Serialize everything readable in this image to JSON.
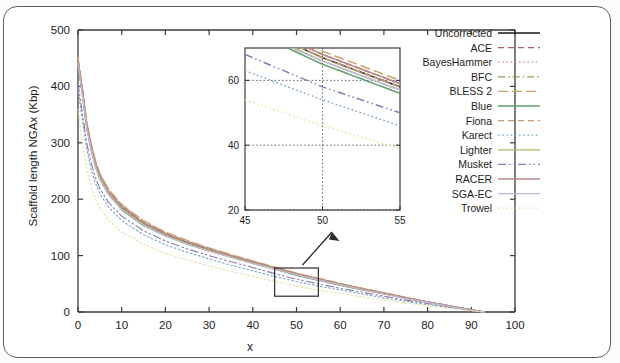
{
  "figure": {
    "xlabel": "x",
    "ylabel": "Scaffold length NGAx (Kbp)"
  },
  "chart_data": {
    "type": "line",
    "title": "",
    "xlabel": "x",
    "ylabel": "Scaffold length NGAx (Kbp)",
    "xlim": [
      0,
      100
    ],
    "ylim": [
      0,
      500
    ],
    "xticks": [
      0,
      10,
      20,
      30,
      40,
      50,
      60,
      70,
      80,
      90,
      100
    ],
    "yticks": [
      0,
      100,
      200,
      300,
      400,
      500
    ],
    "grid": false,
    "legend_position": "top-right",
    "x": [
      0,
      1,
      2,
      3,
      4,
      5,
      7,
      10,
      15,
      20,
      25,
      30,
      35,
      40,
      45,
      50,
      55,
      60,
      65,
      70,
      75,
      80,
      85,
      90,
      93
    ],
    "series": [
      {
        "name": "Uncorrected",
        "color": "#1a1a1a",
        "dash": "solid",
        "values": [
          445,
          392,
          330,
          292,
          262,
          240,
          212,
          185,
          157,
          138,
          123,
          110,
          99,
          88,
          78,
          67,
          58,
          49,
          41,
          33,
          25,
          18,
          11,
          4,
          0
        ]
      },
      {
        "name": "ACE",
        "color": "#b05a5a",
        "dash": "dashed",
        "values": [
          448,
          395,
          334,
          295,
          265,
          243,
          215,
          188,
          159,
          140,
          125,
          112,
          100,
          89,
          79,
          68,
          59,
          50,
          42,
          34,
          26,
          18,
          11,
          4,
          0
        ]
      },
      {
        "name": "BayesHammer",
        "color": "#d08fa0",
        "dash": "dotted",
        "values": [
          450,
          398,
          336,
          297,
          267,
          245,
          217,
          190,
          161,
          141,
          126,
          113,
          101,
          90,
          79,
          68,
          59,
          50,
          42,
          34,
          26,
          18,
          11,
          4,
          0
        ]
      },
      {
        "name": "BFC",
        "color": "#9a9a52",
        "dash": "dashdot",
        "values": [
          444,
          390,
          329,
          291,
          261,
          239,
          211,
          184,
          156,
          137,
          122,
          110,
          99,
          88,
          78,
          67,
          58,
          49,
          41,
          33,
          25,
          18,
          11,
          4,
          0
        ]
      },
      {
        "name": "BLESS 2",
        "color": "#c9a46b",
        "dash": "longdash",
        "values": [
          452,
          400,
          338,
          299,
          269,
          246,
          218,
          191,
          162,
          142,
          127,
          114,
          102,
          91,
          80,
          69,
          60,
          51,
          42,
          34,
          26,
          18,
          11,
          4,
          0
        ]
      },
      {
        "name": "Blue",
        "color": "#5e9e6e",
        "dash": "solid",
        "values": [
          438,
          384,
          324,
          286,
          257,
          235,
          208,
          181,
          153,
          135,
          120,
          108,
          97,
          86,
          76,
          65,
          56,
          47,
          39,
          32,
          24,
          17,
          10,
          3,
          0
        ]
      },
      {
        "name": "Fiona",
        "color": "#c49a7a",
        "dash": "dashed",
        "values": [
          446,
          393,
          332,
          293,
          263,
          241,
          213,
          186,
          158,
          139,
          124,
          111,
          100,
          89,
          78,
          67,
          58,
          49,
          41,
          33,
          25,
          18,
          11,
          4,
          0
        ]
      },
      {
        "name": "Karect",
        "color": "#7aa8c4",
        "dash": "dotted",
        "values": [
          395,
          340,
          290,
          252,
          228,
          210,
          186,
          162,
          137,
          119,
          106,
          94,
          83,
          73,
          63,
          54,
          46,
          39,
          32,
          25,
          19,
          13,
          8,
          3,
          0
        ]
      },
      {
        "name": "Lighter",
        "color": "#a8b86a",
        "dash": "solid",
        "values": [
          442,
          388,
          327,
          289,
          259,
          237,
          210,
          183,
          155,
          136,
          121,
          109,
          98,
          87,
          77,
          66,
          57,
          48,
          40,
          32,
          25,
          17,
          10,
          4,
          0
        ]
      },
      {
        "name": "Musket",
        "color": "#8a7ab5",
        "dash": "dashdotdot",
        "values": [
          405,
          352,
          300,
          264,
          238,
          219,
          194,
          170,
          144,
          126,
          112,
          100,
          89,
          79,
          68,
          58,
          50,
          42,
          35,
          28,
          21,
          15,
          9,
          3,
          0
        ]
      },
      {
        "name": "RACER",
        "color": "#b88a8a",
        "dash": "solid",
        "values": [
          447,
          394,
          333,
          294,
          264,
          242,
          214,
          187,
          158,
          139,
          124,
          112,
          100,
          89,
          79,
          68,
          59,
          50,
          41,
          33,
          25,
          18,
          11,
          4,
          0
        ]
      },
      {
        "name": "SGA-EC",
        "color": "#c7b9d6",
        "dash": "solid",
        "values": [
          441,
          387,
          326,
          288,
          258,
          236,
          209,
          182,
          154,
          135,
          121,
          108,
          97,
          86,
          76,
          66,
          57,
          48,
          40,
          32,
          24,
          17,
          10,
          3,
          0
        ]
      },
      {
        "name": "Trowel",
        "color": "#e8e2a8",
        "dash": "dotted",
        "values": [
          360,
          300,
          255,
          222,
          200,
          184,
          163,
          142,
          120,
          104,
          92,
          82,
          72,
          63,
          54,
          46,
          39,
          33,
          27,
          21,
          16,
          11,
          6,
          2,
          0
        ]
      }
    ],
    "inset": {
      "xlim": [
        45,
        55
      ],
      "ylim": [
        20,
        70
      ],
      "xticks": [
        45,
        50,
        55
      ],
      "yticks": [
        20,
        40,
        60
      ],
      "grid": true,
      "note": "magnified view of highlighted region"
    },
    "highlight_box": {
      "x0": 45,
      "x1": 55,
      "y0": 28,
      "y1": 78
    },
    "annotation": "arrow from highlight box to inset"
  },
  "legend": {
    "items": [
      {
        "label": "Uncorrected"
      },
      {
        "label": "ACE"
      },
      {
        "label": "BayesHammer"
      },
      {
        "label": "BFC"
      },
      {
        "label": "BLESS 2"
      },
      {
        "label": "Blue"
      },
      {
        "label": "Fiona"
      },
      {
        "label": "Karect"
      },
      {
        "label": "Lighter"
      },
      {
        "label": "Musket"
      },
      {
        "label": "RACER"
      },
      {
        "label": "SGA-EC"
      },
      {
        "label": "Trowel"
      }
    ]
  }
}
